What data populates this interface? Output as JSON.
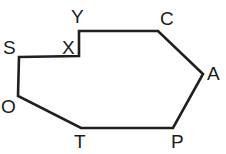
{
  "figure": {
    "type": "polygon-diagram",
    "stroke_color": "#1f1f1f",
    "stroke_width": 2.6,
    "fill_color": "none",
    "background_color": "#ffffff",
    "label_color": "#1b1b1b",
    "canvas": {
      "width": 226,
      "height": 154
    },
    "vertices": [
      {
        "id": "S",
        "label": "S",
        "x": 19,
        "y": 57,
        "label_x": 3,
        "label_y": 38
      },
      {
        "id": "X",
        "label": "X",
        "x": 79,
        "y": 56,
        "label_x": 62,
        "label_y": 38
      },
      {
        "id": "Y",
        "label": "Y",
        "x": 79,
        "y": 31,
        "label_x": 71,
        "label_y": 7
      },
      {
        "id": "C",
        "label": "C",
        "x": 158,
        "y": 31,
        "label_x": 160,
        "label_y": 9
      },
      {
        "id": "A",
        "label": "A",
        "x": 203,
        "y": 74,
        "label_x": 207,
        "label_y": 64
      },
      {
        "id": "P",
        "label": "P",
        "x": 173,
        "y": 128,
        "label_x": 171,
        "label_y": 132
      },
      {
        "id": "T",
        "label": "T",
        "x": 81,
        "y": 128,
        "label_x": 74,
        "label_y": 132
      },
      {
        "id": "O",
        "label": "O",
        "x": 18,
        "y": 96,
        "label_x": 1,
        "label_y": 97
      }
    ],
    "path_points": "19,57 79,56 79,31 158,31 203,74 173,128 81,128 18,96",
    "closed": true,
    "edges": [
      {
        "from": "S",
        "to": "X"
      },
      {
        "from": "X",
        "to": "Y"
      },
      {
        "from": "Y",
        "to": "C"
      },
      {
        "from": "C",
        "to": "A"
      },
      {
        "from": "A",
        "to": "P"
      },
      {
        "from": "P",
        "to": "T"
      },
      {
        "from": "T",
        "to": "O"
      },
      {
        "from": "O",
        "to": "S"
      }
    ]
  }
}
